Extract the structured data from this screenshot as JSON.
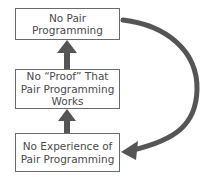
{
  "diagram": {
    "type": "cycle",
    "nodes": [
      {
        "id": "no-pair-programming",
        "lines": [
          "No Pair",
          "Programming"
        ]
      },
      {
        "id": "no-proof",
        "lines": [
          "No “Proof” That",
          "Pair Programming",
          "Works"
        ]
      },
      {
        "id": "no-experience",
        "lines": [
          "No Experience of",
          "Pair Programming"
        ]
      }
    ],
    "edges": [
      {
        "from": "no-proof",
        "to": "no-pair-programming",
        "style": "straight-arrow"
      },
      {
        "from": "no-experience",
        "to": "no-proof",
        "style": "straight-arrow"
      },
      {
        "from": "no-pair-programming",
        "to": "no-experience",
        "style": "curved-arrow"
      }
    ],
    "colors": {
      "arrow": "#555555",
      "border": "#6a6a6a",
      "text": "#4a4a4a"
    }
  }
}
